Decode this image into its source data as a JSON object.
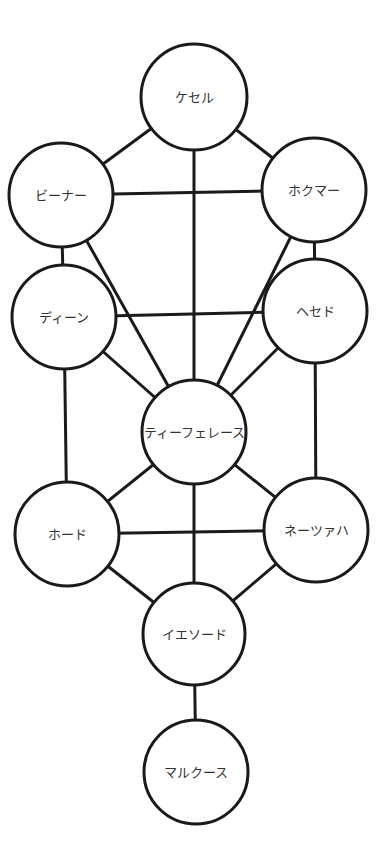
{
  "diagram": {
    "title": "",
    "stroke_color": "#1a1a1a",
    "fill_color": "#ffffff",
    "text_color": "#333333",
    "nodes": [
      {
        "id": "kether",
        "label": "ケセル",
        "cx": 194,
        "cy": 97,
        "r": 53
      },
      {
        "id": "binah",
        "label": "ビーナー",
        "cx": 61,
        "cy": 195,
        "r": 52
      },
      {
        "id": "chokmah",
        "label": "ホクマー",
        "cx": 314,
        "cy": 190,
        "r": 52
      },
      {
        "id": "din",
        "label": "ディーン",
        "cx": 64,
        "cy": 317,
        "r": 52
      },
      {
        "id": "chesed",
        "label": "ヘセド",
        "cx": 315,
        "cy": 311,
        "r": 52
      },
      {
        "id": "tiphereth",
        "label": "ティーフェレース",
        "cx": 194,
        "cy": 432,
        "r": 52
      },
      {
        "id": "hod",
        "label": "ホード",
        "cx": 67,
        "cy": 534,
        "r": 52
      },
      {
        "id": "netzach",
        "label": "ネーツァハ",
        "cx": 316,
        "cy": 530,
        "r": 52
      },
      {
        "id": "yesod",
        "label": "イエソード",
        "cx": 194,
        "cy": 634,
        "r": 51
      },
      {
        "id": "malkuth",
        "label": "マルクース",
        "cx": 196,
        "cy": 772,
        "r": 52
      }
    ],
    "edges": [
      [
        "kether",
        "binah"
      ],
      [
        "kether",
        "chokmah"
      ],
      [
        "kether",
        "tiphereth"
      ],
      [
        "binah",
        "chokmah"
      ],
      [
        "binah",
        "din"
      ],
      [
        "chokmah",
        "chesed"
      ],
      [
        "binah",
        "tiphereth"
      ],
      [
        "chokmah",
        "tiphereth"
      ],
      [
        "din",
        "chesed"
      ],
      [
        "din",
        "tiphereth"
      ],
      [
        "chesed",
        "tiphereth"
      ],
      [
        "din",
        "hod"
      ],
      [
        "chesed",
        "netzach"
      ],
      [
        "tiphereth",
        "hod"
      ],
      [
        "tiphereth",
        "netzach"
      ],
      [
        "tiphereth",
        "yesod"
      ],
      [
        "hod",
        "netzach"
      ],
      [
        "hod",
        "yesod"
      ],
      [
        "netzach",
        "yesod"
      ],
      [
        "yesod",
        "malkuth"
      ]
    ]
  }
}
